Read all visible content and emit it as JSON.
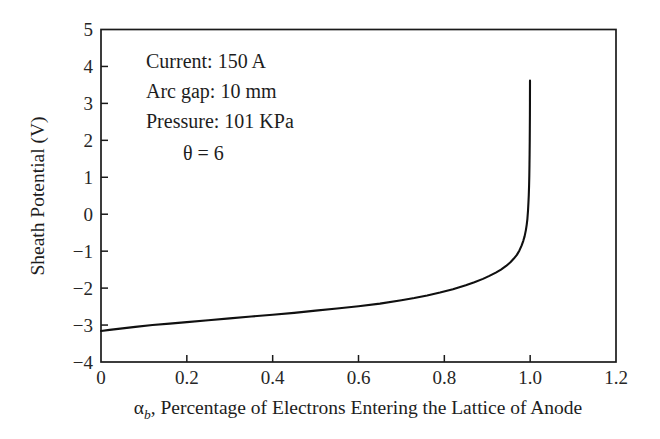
{
  "chart_data": {
    "type": "line",
    "title": "",
    "xlabel": "αb, Percentage of Electrons Entering the Lattice of Anode",
    "xlabel_symbol": "α",
    "xlabel_subscript": "b",
    "xlabel_rest": ", Percentage of Electrons Entering the Lattice of Anode",
    "ylabel": "Sheath Potential (V)",
    "xlim": [
      0,
      1.2
    ],
    "ylim": [
      -4,
      5
    ],
    "xticks": [
      "0",
      "0.2",
      "0.4",
      "0.6",
      "0.8",
      "1.0",
      "1.2"
    ],
    "xtick_values": [
      0,
      0.2,
      0.4,
      0.6,
      0.8,
      1.0,
      1.2
    ],
    "yticks": [
      "5",
      "4",
      "3",
      "2",
      "1",
      "0",
      "−1",
      "−2",
      "−3",
      "−4"
    ],
    "ytick_values": [
      5,
      4,
      3,
      2,
      1,
      0,
      -1,
      -2,
      -3,
      -4
    ],
    "grid": false,
    "legend": null,
    "line_color": "#101010",
    "series": [
      {
        "name": "Sheath potential vs alpha_b",
        "x": [
          0.0,
          0.02,
          0.05,
          0.08,
          0.12,
          0.16,
          0.2,
          0.25,
          0.3,
          0.35,
          0.4,
          0.45,
          0.5,
          0.55,
          0.6,
          0.65,
          0.7,
          0.73,
          0.76,
          0.79,
          0.82,
          0.85,
          0.87,
          0.89,
          0.905,
          0.92,
          0.932,
          0.944,
          0.954,
          0.962,
          0.969,
          0.975,
          0.98,
          0.984,
          0.987,
          0.99,
          0.992,
          0.9935,
          0.995,
          0.996,
          0.9968,
          0.9975,
          0.998,
          0.9984,
          0.9987,
          0.999,
          0.9992,
          0.9994,
          0.9995,
          0.9996
        ],
        "y": [
          -3.16,
          -3.13,
          -3.09,
          -3.05,
          -3.0,
          -2.96,
          -2.92,
          -2.87,
          -2.82,
          -2.77,
          -2.72,
          -2.67,
          -2.61,
          -2.55,
          -2.49,
          -2.42,
          -2.33,
          -2.27,
          -2.2,
          -2.12,
          -2.03,
          -1.92,
          -1.84,
          -1.75,
          -1.67,
          -1.58,
          -1.5,
          -1.4,
          -1.3,
          -1.2,
          -1.1,
          -0.98,
          -0.85,
          -0.72,
          -0.6,
          -0.43,
          -0.28,
          -0.13,
          0.1,
          0.32,
          0.52,
          0.78,
          1.05,
          1.35,
          1.62,
          1.98,
          2.32,
          2.7,
          3.05,
          3.62
        ]
      }
    ],
    "annotations": [
      {
        "id": "current",
        "text": "Current: 150 A"
      },
      {
        "id": "arc-gap",
        "text": "Arc gap: 10 mm"
      },
      {
        "id": "pressure",
        "text": "Pressure: 101 KPa"
      },
      {
        "id": "theta",
        "text": "θ = 6"
      }
    ]
  }
}
